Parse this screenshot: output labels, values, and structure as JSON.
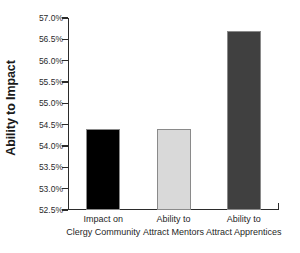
{
  "chart_data": {
    "type": "bar",
    "title": "",
    "subtitle": "",
    "xlabel": "",
    "ylabel": "Ability to Impact",
    "categories": [
      "Impact on Clergy Community",
      "Ability to Attract Mentors",
      "Ability to Attract Apprentices"
    ],
    "category_lines": [
      [
        "Impact on",
        "Clergy Community"
      ],
      [
        "Ability to",
        "Attract Mentors"
      ],
      [
        "Ability to",
        "Attract Apprentices"
      ]
    ],
    "values": [
      54.4,
      54.4,
      56.7
    ],
    "value_labels": [
      "54.4%",
      "54.4%",
      "56.7%"
    ],
    "ylim": [
      52.5,
      57.0
    ],
    "ytick_values": [
      52.5,
      53.0,
      53.5,
      54.0,
      54.5,
      55.0,
      55.5,
      56.0,
      56.5,
      57.0
    ],
    "ytick_labels": [
      "52.5%",
      "53.0%",
      "53.5%",
      "54.0%",
      "54.5%",
      "55.0%",
      "55.5%",
      "56.0%",
      "56.5%",
      "57.0%"
    ],
    "grid": false,
    "legend": false,
    "legend_position": "none",
    "bar_colors": [
      "#000000",
      "#d9d9d9",
      "#404040"
    ],
    "bar_border_color": "#8a8a8a",
    "axis_color": "#2b2b2b",
    "background_color": "#ffffff"
  }
}
